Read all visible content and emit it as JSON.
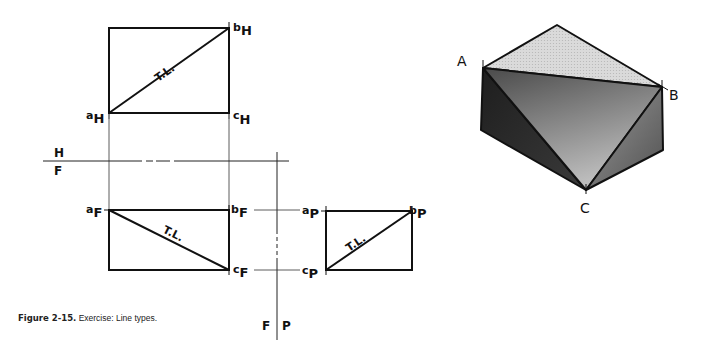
{
  "figure": {
    "caption_bold": "Figure 2-15.",
    "caption_text": " Exercise: Line types."
  },
  "views": {
    "top": {
      "point_a": "a",
      "point_a_sub": "H",
      "point_b": "b",
      "point_b_sub": "H",
      "point_c": "c",
      "point_c_sub": "H",
      "line_label": "T.L."
    },
    "front": {
      "point_a": "a",
      "point_a_sub": "F",
      "point_b": "b",
      "point_b_sub": "F",
      "point_c": "c",
      "point_c_sub": "F",
      "line_label": "T.L."
    },
    "profile": {
      "point_a": "a",
      "point_a_sub": "P",
      "point_b": "b",
      "point_b_sub": "P",
      "point_c": "c",
      "point_c_sub": "P",
      "line_label": "T.L."
    }
  },
  "fold_lines": {
    "hf": {
      "upper": "H",
      "lower": "F"
    },
    "fp": {
      "left": "F",
      "right": "P"
    }
  },
  "isometric": {
    "label_a": "A",
    "label_b": "B",
    "label_c": "C",
    "colors": {
      "top_face": "#d4d4d4",
      "left_face": "#2a2a2a",
      "cut_face": "#8a8a8a",
      "right_face": "#6e6e6e",
      "edge": "#111111"
    }
  }
}
